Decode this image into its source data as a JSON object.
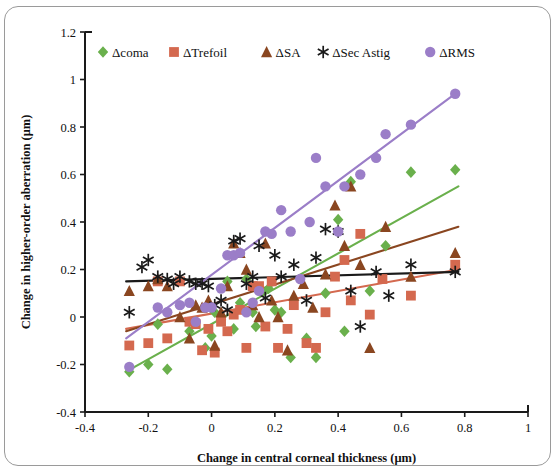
{
  "chart_data": {
    "type": "scatter",
    "title": "",
    "xlabel": "Change in central corneal thickness (μm)",
    "ylabel": "Change in higher-order aberration  (μm)",
    "xlim": [
      -0.4,
      1.0
    ],
    "ylim": [
      -0.4,
      1.2
    ],
    "xticks": [
      -0.4,
      -0.2,
      0,
      0.2,
      0.4,
      0.6,
      0.8,
      1
    ],
    "xtick_labels": [
      "-0.4",
      "-0.2",
      "0",
      "0.2",
      "0.4",
      "0.6",
      "0.8",
      "1"
    ],
    "yticks": [
      -0.4,
      -0.2,
      0,
      0.2,
      0.4,
      0.6,
      0.8,
      1,
      1.2
    ],
    "ytick_labels": [
      "-0.4",
      "-0.2",
      "0",
      "0.2",
      "0.4",
      "0.6",
      "0.8",
      "1",
      "1.2"
    ],
    "grid": false,
    "legend_position": "top",
    "series": [
      {
        "name": "Δcoma",
        "marker": "diamond",
        "color": "#6ab04c",
        "points": [
          [
            -0.26,
            -0.23
          ],
          [
            -0.2,
            -0.2
          ],
          [
            -0.17,
            -0.03
          ],
          [
            -0.14,
            -0.22
          ],
          [
            -0.07,
            -0.06
          ],
          [
            -0.05,
            -0.02
          ],
          [
            -0.02,
            -0.13
          ],
          [
            0.0,
            -0.08
          ],
          [
            0.01,
            0.02
          ],
          [
            0.03,
            -0.01
          ],
          [
            0.05,
            0.15
          ],
          [
            0.07,
            -0.05
          ],
          [
            0.09,
            0.06
          ],
          [
            0.11,
            0.16
          ],
          [
            0.13,
            0.02
          ],
          [
            0.14,
            -0.04
          ],
          [
            0.16,
            0.11
          ],
          [
            0.18,
            0.12
          ],
          [
            0.2,
            0.03
          ],
          [
            0.22,
            0.02
          ],
          [
            0.25,
            -0.17
          ],
          [
            0.3,
            -0.09
          ],
          [
            0.33,
            -0.17
          ],
          [
            0.36,
            0.1
          ],
          [
            0.4,
            0.41
          ],
          [
            0.42,
            -0.06
          ],
          [
            0.44,
            0.57
          ],
          [
            0.5,
            0.11
          ],
          [
            0.55,
            0.3
          ],
          [
            0.63,
            0.61
          ],
          [
            0.77,
            0.62
          ]
        ],
        "trendline": {
          "x0": -0.27,
          "y0": -0.23,
          "x1": 0.78,
          "y1": 0.55
        }
      },
      {
        "name": "ΔTrefoil",
        "marker": "square",
        "color": "#d4694f",
        "points": [
          [
            -0.26,
            -0.12
          ],
          [
            -0.2,
            -0.11
          ],
          [
            -0.17,
            0.15
          ],
          [
            -0.14,
            -0.09
          ],
          [
            -0.1,
            0.15
          ],
          [
            -0.07,
            -0.02
          ],
          [
            -0.05,
            -0.03
          ],
          [
            -0.03,
            -0.14
          ],
          [
            -0.01,
            -0.05
          ],
          [
            0.01,
            -0.15
          ],
          [
            0.03,
            -0.02
          ],
          [
            0.05,
            -0.06
          ],
          [
            0.07,
            0.01
          ],
          [
            0.09,
            0.03
          ],
          [
            0.11,
            -0.13
          ],
          [
            0.13,
            0.13
          ],
          [
            0.15,
            0.13
          ],
          [
            0.17,
            -0.04
          ],
          [
            0.19,
            0.15
          ],
          [
            0.21,
            -0.13
          ],
          [
            0.24,
            -0.05
          ],
          [
            0.26,
            0.05
          ],
          [
            0.3,
            -0.11
          ],
          [
            0.33,
            -0.13
          ],
          [
            0.36,
            0.02
          ],
          [
            0.39,
            0.17
          ],
          [
            0.42,
            0.24
          ],
          [
            0.44,
            0.07
          ],
          [
            0.47,
            0.35
          ],
          [
            0.5,
            0.01
          ],
          [
            0.54,
            0.16
          ],
          [
            0.63,
            0.09
          ],
          [
            0.77,
            0.22
          ]
        ],
        "trendline": {
          "x0": -0.27,
          "y0": -0.05,
          "x1": 0.78,
          "y1": 0.2
        }
      },
      {
        "name": "ΔSA",
        "marker": "triangle",
        "color": "#8a4620",
        "points": [
          [
            -0.26,
            0.11
          ],
          [
            -0.2,
            0.13
          ],
          [
            -0.17,
            0.16
          ],
          [
            -0.14,
            0.13
          ],
          [
            -0.1,
            0.0
          ],
          [
            -0.07,
            -0.09
          ],
          [
            -0.05,
            0.05
          ],
          [
            -0.03,
            0.04
          ],
          [
            -0.01,
            0.07
          ],
          [
            0.01,
            -0.12
          ],
          [
            0.03,
            0.02
          ],
          [
            0.05,
            0.13
          ],
          [
            0.07,
            0.31
          ],
          [
            0.09,
            0.27
          ],
          [
            0.11,
            0.2
          ],
          [
            0.13,
            0.05
          ],
          [
            0.15,
            0.0
          ],
          [
            0.17,
            0.31
          ],
          [
            0.19,
            0.07
          ],
          [
            0.21,
            0.0
          ],
          [
            0.24,
            -0.14
          ],
          [
            0.26,
            0.09
          ],
          [
            0.29,
            0.14
          ],
          [
            0.32,
            0.04
          ],
          [
            0.36,
            0.18
          ],
          [
            0.39,
            0.47
          ],
          [
            0.42,
            0.3
          ],
          [
            0.44,
            0.55
          ],
          [
            0.47,
            0.22
          ],
          [
            0.5,
            -0.13
          ],
          [
            0.55,
            0.38
          ],
          [
            0.63,
            0.17
          ],
          [
            0.77,
            0.27
          ]
        ],
        "trendline": {
          "x0": -0.27,
          "y0": -0.06,
          "x1": 0.78,
          "y1": 0.38
        }
      },
      {
        "name": "ΔSec Astig",
        "marker": "asterisk",
        "color": "#1a1a1a",
        "points": [
          [
            -0.26,
            0.02
          ],
          [
            -0.22,
            0.21
          ],
          [
            -0.2,
            0.24
          ],
          [
            -0.17,
            0.17
          ],
          [
            -0.14,
            0.16
          ],
          [
            -0.12,
            0.14
          ],
          [
            -0.1,
            0.17
          ],
          [
            -0.07,
            0.15
          ],
          [
            -0.05,
            0.14
          ],
          [
            -0.03,
            0.14
          ],
          [
            -0.01,
            0.13
          ],
          [
            0.01,
            0.05
          ],
          [
            0.03,
            0.07
          ],
          [
            0.05,
            0.03
          ],
          [
            0.07,
            0.32
          ],
          [
            0.09,
            0.33
          ],
          [
            0.11,
            0.14
          ],
          [
            0.13,
            0.17
          ],
          [
            0.15,
            0.3
          ],
          [
            0.17,
            0.08
          ],
          [
            0.2,
            0.26
          ],
          [
            0.22,
            0.17
          ],
          [
            0.26,
            0.22
          ],
          [
            0.3,
            0.07
          ],
          [
            0.33,
            0.25
          ],
          [
            0.36,
            0.37
          ],
          [
            0.4,
            0.36
          ],
          [
            0.44,
            0.11
          ],
          [
            0.47,
            -0.04
          ],
          [
            0.52,
            0.19
          ],
          [
            0.56,
            0.09
          ],
          [
            0.63,
            0.22
          ],
          [
            0.77,
            0.19
          ]
        ],
        "trendline": {
          "x0": -0.27,
          "y0": 0.15,
          "x1": 0.78,
          "y1": 0.19
        }
      },
      {
        "name": "ΔRMS",
        "marker": "circle",
        "color": "#9b7ec8",
        "points": [
          [
            -0.26,
            -0.21
          ],
          [
            -0.17,
            0.04
          ],
          [
            -0.14,
            0.02
          ],
          [
            -0.1,
            0.05
          ],
          [
            -0.07,
            0.06
          ],
          [
            -0.05,
            -0.02
          ],
          [
            -0.02,
            0.04
          ],
          [
            0.0,
            0.04
          ],
          [
            0.03,
            0.12
          ],
          [
            0.05,
            0.26
          ],
          [
            0.07,
            0.26
          ],
          [
            0.09,
            0.27
          ],
          [
            0.11,
            0.02
          ],
          [
            0.13,
            0.06
          ],
          [
            0.15,
            0.11
          ],
          [
            0.17,
            0.36
          ],
          [
            0.19,
            0.35
          ],
          [
            0.22,
            0.45
          ],
          [
            0.25,
            0.36
          ],
          [
            0.28,
            0.16
          ],
          [
            0.31,
            0.4
          ],
          [
            0.33,
            0.67
          ],
          [
            0.36,
            0.55
          ],
          [
            0.4,
            0.36
          ],
          [
            0.42,
            0.55
          ],
          [
            0.47,
            0.6
          ],
          [
            0.52,
            0.67
          ],
          [
            0.55,
            0.77
          ],
          [
            0.63,
            0.81
          ],
          [
            0.77,
            0.94
          ]
        ],
        "trendline": {
          "x0": -0.27,
          "y0": -0.09,
          "x1": 0.78,
          "y1": 0.95
        }
      }
    ],
    "legend": [
      {
        "label": "Δcoma",
        "marker": "diamond",
        "color": "#6ab04c"
      },
      {
        "label": "ΔTrefoil",
        "marker": "square",
        "color": "#d4694f"
      },
      {
        "label": "ΔSA",
        "marker": "triangle",
        "color": "#8a4620"
      },
      {
        "label": "ΔSec Astig",
        "marker": "asterisk",
        "color": "#1a1a1a"
      },
      {
        "label": "ΔRMS",
        "marker": "circle",
        "color": "#9b7ec8"
      }
    ]
  }
}
